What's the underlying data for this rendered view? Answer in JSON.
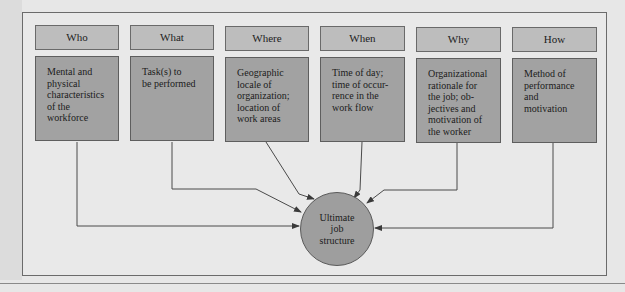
{
  "diagram": {
    "type": "flow",
    "columns": [
      {
        "header": "Who",
        "description": "Mental and\nphysical\ncharacteristics\nof the\nworkforce"
      },
      {
        "header": "What",
        "description": "Task(s) to\nbe performed"
      },
      {
        "header": "Where",
        "description": "Geographic\nlocale of\norganization;\nlocation of\nwork areas"
      },
      {
        "header": "When",
        "description": "Time of day;\ntime of occur-\nrence in the\nwork flow"
      },
      {
        "header": "Why",
        "description": "Organizational\nrationale for\nthe job; ob-\njectives and\nmotivation of\nthe worker"
      },
      {
        "header": "How",
        "description": "Method of\nperformance and\nmotivation"
      }
    ],
    "target": {
      "label": "Ultimate\njob\nstructure"
    },
    "edges": [
      {
        "from": "Who",
        "to": "Ultimate job structure"
      },
      {
        "from": "What",
        "to": "Ultimate job structure"
      },
      {
        "from": "Where",
        "to": "Ultimate job structure"
      },
      {
        "from": "When",
        "to": "Ultimate job structure"
      },
      {
        "from": "Why",
        "to": "Ultimate job structure"
      },
      {
        "from": "How",
        "to": "Ultimate job structure"
      }
    ],
    "colors": {
      "header_fill": "#bdbdbd",
      "body_fill": "#a2a2a2",
      "circle_fill": "#9e9e9e",
      "background": "#e9e9e9",
      "line": "#4a4a4a"
    }
  }
}
